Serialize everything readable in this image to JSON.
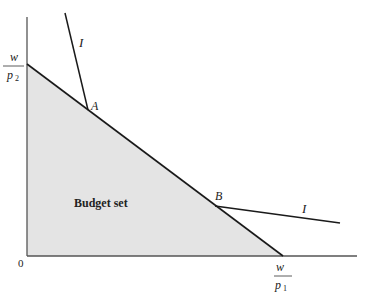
{
  "diagram": {
    "type": "economics-budget-set",
    "region_label": "Budget set",
    "origin_label": "0",
    "y_intercept_label": {
      "numerator": "w",
      "denominator": "p",
      "subscript": "2"
    },
    "x_intercept_label": {
      "numerator": "w",
      "denominator": "p",
      "subscript": "1"
    },
    "points": [
      {
        "id": "A",
        "label": "A"
      },
      {
        "id": "B",
        "label": "B"
      }
    ],
    "indifference_curves": [
      {
        "label": "I",
        "through": "A"
      },
      {
        "label": "I",
        "through": "B"
      }
    ],
    "colors": {
      "shade": "#e6e6e6",
      "line": "#1a1a1a",
      "axis": "#555555"
    }
  }
}
